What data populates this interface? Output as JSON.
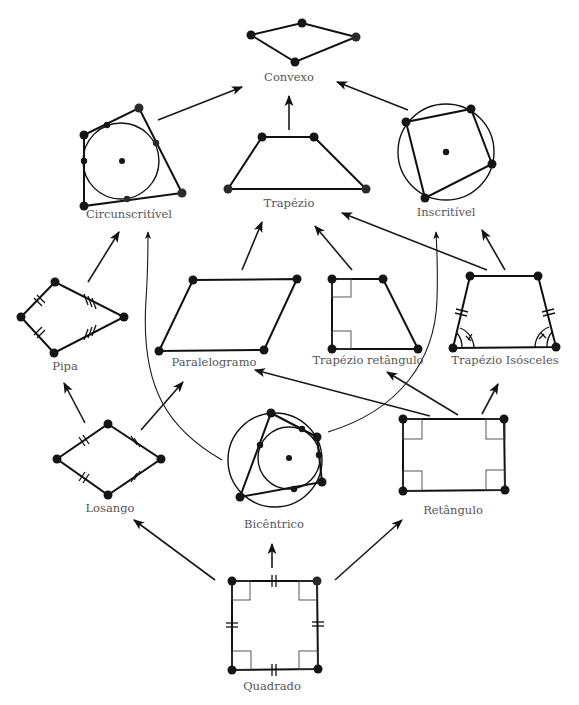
{
  "diagram": {
    "nodes": [
      {
        "id": "convexo",
        "label": "Convexo"
      },
      {
        "id": "circunscritivel",
        "label": "Circunscritível"
      },
      {
        "id": "trapezio",
        "label": "Trapézio"
      },
      {
        "id": "inscritivel",
        "label": "Inscritível"
      },
      {
        "id": "pipa",
        "label": "Pipa"
      },
      {
        "id": "paralelogramo",
        "label": "Paralelogramo"
      },
      {
        "id": "trapezio_retangulo",
        "label": "Trapézio retângulo"
      },
      {
        "id": "trapezio_isosceles",
        "label": "Trapézio Isósceles"
      },
      {
        "id": "losango",
        "label": "Losango"
      },
      {
        "id": "bicentrico",
        "label": "Bicêntrico"
      },
      {
        "id": "retangulo",
        "label": "Retângulo"
      },
      {
        "id": "quadrado",
        "label": "Quadrado"
      }
    ],
    "edges": [
      {
        "from": "circunscritivel",
        "to": "convexo"
      },
      {
        "from": "trapezio",
        "to": "convexo"
      },
      {
        "from": "inscritivel",
        "to": "convexo"
      },
      {
        "from": "pipa",
        "to": "circunscritivel"
      },
      {
        "from": "bicentrico",
        "to": "circunscritivel",
        "curved": true
      },
      {
        "from": "paralelogramo",
        "to": "trapezio"
      },
      {
        "from": "trapezio_retangulo",
        "to": "trapezio"
      },
      {
        "from": "trapezio_isosceles",
        "to": "trapezio"
      },
      {
        "from": "trapezio_isosceles",
        "to": "inscritivel"
      },
      {
        "from": "bicentrico",
        "to": "inscritivel",
        "curved": true
      },
      {
        "from": "losango",
        "to": "pipa"
      },
      {
        "from": "losango",
        "to": "paralelogramo"
      },
      {
        "from": "retangulo",
        "to": "paralelogramo"
      },
      {
        "from": "retangulo",
        "to": "trapezio_retangulo"
      },
      {
        "from": "retangulo",
        "to": "trapezio_isosceles"
      },
      {
        "from": "quadrado",
        "to": "losango"
      },
      {
        "from": "quadrado",
        "to": "bicentrico"
      },
      {
        "from": "quadrado",
        "to": "retangulo"
      }
    ]
  }
}
